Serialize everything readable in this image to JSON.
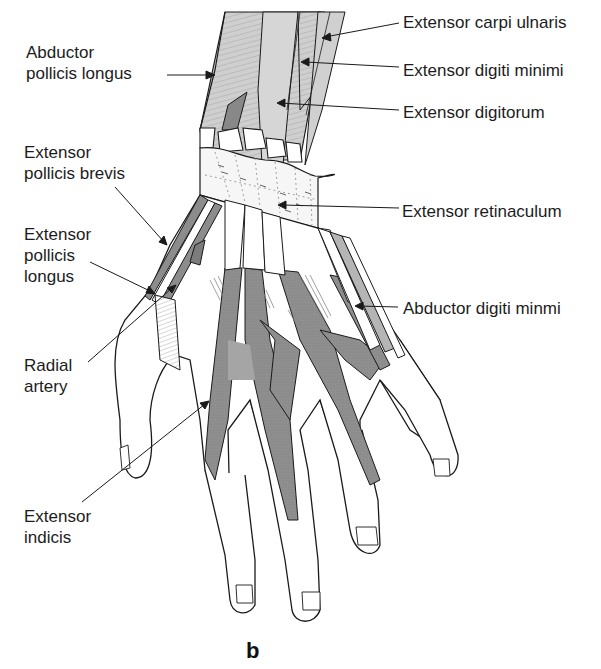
{
  "figure": {
    "panel_letter": "b",
    "colors": {
      "outline": "#1a1a1a",
      "muscle_fill": "#c9c9c9",
      "tendon_fill": "#8c8c8c",
      "dark_tendon": "#7a7a7a",
      "skin": "#ffffff",
      "retinaculum": "#f4f4f4"
    }
  },
  "labels": {
    "abductor_pollicis_longus": {
      "lines": [
        "Abductor",
        "pollicis longus"
      ]
    },
    "extensor_pollicis_brevis": {
      "lines": [
        "Extensor",
        "pollicis brevis"
      ]
    },
    "extensor_pollicis_longus": {
      "lines": [
        "Extensor",
        "pollicis",
        "longus"
      ]
    },
    "radial_artery": {
      "lines": [
        "Radial",
        "artery"
      ]
    },
    "extensor_indicis": {
      "lines": [
        "Extensor",
        "indicis"
      ]
    },
    "extensor_carpi_ulnaris": {
      "lines": [
        "Extensor carpi ulnaris"
      ]
    },
    "extensor_digiti_minimi": {
      "lines": [
        "Extensor digiti minimi"
      ]
    },
    "extensor_digitorum": {
      "lines": [
        "Extensor digitorum"
      ]
    },
    "extensor_retinaculum": {
      "lines": [
        "Extensor retinaculum"
      ]
    },
    "abductor_digiti_minmi": {
      "lines": [
        "Abductor digiti minmi"
      ]
    }
  }
}
